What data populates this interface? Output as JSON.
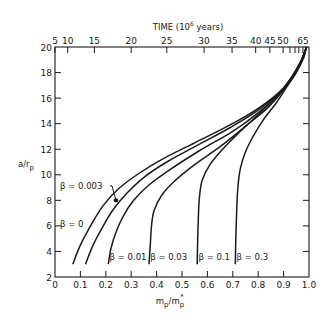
{
  "chart_data": {
    "type": "line",
    "title": "",
    "xlabel": "m_p/m_p*",
    "ylabel": "a/r_p",
    "top_xlabel": "TIME (10^6 years)",
    "xlim": [
      0,
      1.0
    ],
    "ylim": [
      2,
      20
    ],
    "grid": false,
    "legend_position": "inline annotations",
    "x_ticks": [
      0,
      0.1,
      0.2,
      0.3,
      0.4,
      0.5,
      0.6,
      0.7,
      0.8,
      0.9,
      1.0
    ],
    "x_tick_labels": [
      "0",
      "0.1",
      "0.2",
      "0.3",
      "0.4",
      "0.5",
      "0.6",
      "0.7",
      "0.8",
      "0.9",
      "1.0"
    ],
    "y_ticks": [
      2,
      4,
      6,
      8,
      10,
      12,
      14,
      16,
      18,
      20
    ],
    "y_tick_labels": [
      "2",
      "4",
      "6",
      "8",
      "10",
      "12",
      "14",
      "16",
      "18",
      "20"
    ],
    "top_axis_ticks": [
      {
        "label": "5",
        "x": 0.0
      },
      {
        "label": "10",
        "x": 0.05
      },
      {
        "label": "15",
        "x": 0.155
      },
      {
        "label": "20",
        "x": 0.3
      },
      {
        "label": "25",
        "x": 0.44
      },
      {
        "label": "30",
        "x": 0.587
      },
      {
        "label": "35",
        "x": 0.697
      },
      {
        "label": "40",
        "x": 0.79
      },
      {
        "label": "45",
        "x": 0.846
      },
      {
        "label": "50",
        "x": 0.898
      },
      {
        "label": "",
        "x": 0.925
      },
      {
        "label": "",
        "x": 0.945
      },
      {
        "label": "",
        "x": 0.96
      },
      {
        "label": "65",
        "x": 0.976
      }
    ],
    "series": [
      {
        "name": "β = 0",
        "points": [
          [
            0.07,
            3
          ],
          [
            0.1,
            4.5
          ],
          [
            0.14,
            6
          ],
          [
            0.19,
            7.6
          ],
          [
            0.25,
            8.9
          ],
          [
            0.33,
            10.1
          ],
          [
            0.43,
            11.3
          ],
          [
            0.55,
            12.5
          ],
          [
            0.68,
            13.8
          ],
          [
            0.8,
            15.2
          ],
          [
            0.9,
            16.8
          ],
          [
            0.96,
            18.5
          ],
          [
            0.99,
            20
          ]
        ]
      },
      {
        "name": "β = 0.003",
        "points": [
          [
            0.12,
            3
          ],
          [
            0.15,
            4.5
          ],
          [
            0.19,
            6
          ],
          [
            0.23,
            7.3
          ],
          [
            0.28,
            8.5
          ],
          [
            0.35,
            9.8
          ],
          [
            0.44,
            11.0
          ],
          [
            0.56,
            12.3
          ],
          [
            0.69,
            13.7
          ],
          [
            0.81,
            15.2
          ],
          [
            0.9,
            16.8
          ],
          [
            0.96,
            18.5
          ],
          [
            0.99,
            20
          ]
        ]
      },
      {
        "name": "β = 0.01",
        "points": [
          [
            0.21,
            3
          ],
          [
            0.22,
            4.2
          ],
          [
            0.24,
            5.5
          ],
          [
            0.27,
            6.8
          ],
          [
            0.31,
            8.0
          ],
          [
            0.37,
            9.2
          ],
          [
            0.46,
            10.5
          ],
          [
            0.57,
            11.9
          ],
          [
            0.7,
            13.4
          ],
          [
            0.81,
            15.0
          ],
          [
            0.9,
            16.7
          ],
          [
            0.96,
            18.5
          ],
          [
            0.99,
            20
          ]
        ]
      },
      {
        "name": "β = 0.03",
        "points": [
          [
            0.37,
            3
          ],
          [
            0.375,
            4.5
          ],
          [
            0.38,
            6
          ],
          [
            0.39,
            7.2
          ],
          [
            0.42,
            8.4
          ],
          [
            0.47,
            9.5
          ],
          [
            0.55,
            10.8
          ],
          [
            0.65,
            12.2
          ],
          [
            0.75,
            13.8
          ],
          [
            0.84,
            15.3
          ],
          [
            0.91,
            16.9
          ],
          [
            0.96,
            18.5
          ],
          [
            0.99,
            20
          ]
        ]
      },
      {
        "name": "β = 0.1",
        "points": [
          [
            0.56,
            3
          ],
          [
            0.562,
            5
          ],
          [
            0.565,
            7
          ],
          [
            0.57,
            8.5
          ],
          [
            0.58,
            9.6
          ],
          [
            0.61,
            10.8
          ],
          [
            0.66,
            12.0
          ],
          [
            0.73,
            13.4
          ],
          [
            0.81,
            14.9
          ],
          [
            0.88,
            16.3
          ],
          [
            0.93,
            17.6
          ],
          [
            0.97,
            19
          ],
          [
            0.99,
            20
          ]
        ]
      },
      {
        "name": "β = 0.3",
        "points": [
          [
            0.71,
            3
          ],
          [
            0.712,
            5
          ],
          [
            0.715,
            7
          ],
          [
            0.72,
            9
          ],
          [
            0.73,
            10.5
          ],
          [
            0.75,
            11.8
          ],
          [
            0.78,
            13.0
          ],
          [
            0.82,
            14.3
          ],
          [
            0.87,
            15.6
          ],
          [
            0.91,
            16.8
          ],
          [
            0.95,
            18
          ],
          [
            0.98,
            19.2
          ],
          [
            0.99,
            20
          ]
        ]
      }
    ],
    "annotations": [
      {
        "text": "β = 0.003",
        "label_x": 0.02,
        "label_y": 8.9,
        "arrow_to": [
          0.24,
          8.0
        ]
      },
      {
        "text": "β = 0",
        "label_x": 0.02,
        "label_y": 5.9
      },
      {
        "text": "β = 0.01",
        "label_x": 0.215,
        "label_y": 3.3
      },
      {
        "text": "β = 0.03",
        "label_x": 0.375,
        "label_y": 3.3
      },
      {
        "text": "β = 0.1",
        "label_x": 0.565,
        "label_y": 3.3
      },
      {
        "text": "β = 0.3",
        "label_x": 0.715,
        "label_y": 3.3
      }
    ]
  }
}
